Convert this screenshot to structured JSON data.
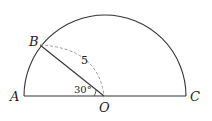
{
  "diagram": {
    "type": "geometry",
    "points": {
      "A": "A",
      "B": "B",
      "O": "O",
      "C": "C"
    },
    "segment_label": "5",
    "angle_label": "30°",
    "colors": {
      "stroke": "#333333",
      "dashed": "#999999"
    }
  }
}
